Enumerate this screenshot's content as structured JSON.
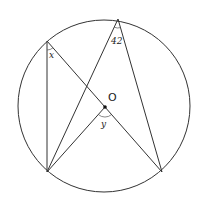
{
  "diagram": {
    "colors": {
      "stroke": "#333333",
      "background": "#ffffff"
    },
    "circle": {
      "cx": 104,
      "cy": 106,
      "r": 86
    },
    "center": {
      "label": "O",
      "x": 105,
      "y": 107
    },
    "points": {
      "top": {
        "x": 118,
        "y": 19
      },
      "upper_left": {
        "x": 47,
        "y": 41
      },
      "bottom_left": {
        "x": 47,
        "y": 172
      },
      "bottom_right": {
        "x": 162,
        "y": 172
      }
    },
    "labels": {
      "angle_top": "42",
      "angle_upper_left": "x",
      "angle_center": "y",
      "center": "O"
    }
  }
}
